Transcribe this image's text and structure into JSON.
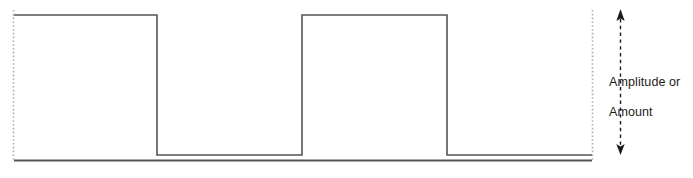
{
  "figure": {
    "background_color": "#ffffff",
    "width": 693,
    "height": 178
  },
  "annotation": {
    "name": "amplitude-or-amount",
    "line1": "Amplitude or",
    "line2": "Amount",
    "text_color": "#1c1c1c",
    "arrow": {
      "name": "double-headed-dashed-arrow",
      "style": "dashed",
      "heads": "both",
      "color": "#1c1c1c",
      "x": 620,
      "y_top": 10,
      "y_bottom": 155
    }
  },
  "guides": {
    "name": "dotted-vertical-guides",
    "color": "#b0b0b0",
    "style": "dotted",
    "lines": [
      {
        "x": 13,
        "y_top": 10,
        "y_bottom": 161
      },
      {
        "x": 592,
        "y_top": 10,
        "y_bottom": 161
      }
    ]
  },
  "axis": {
    "name": "baseline-axis",
    "color": "#555555",
    "y": 160,
    "x_start": 14,
    "x_end": 592,
    "thickness": 2
  },
  "chart_data": {
    "type": "line",
    "title": "Amplitude or Amount",
    "subtitle": "",
    "xlabel": "",
    "ylabel": "Amplitude or Amount",
    "grid": false,
    "legend": null,
    "waveform": "square",
    "stroke_color": "#555555",
    "stroke_width": 1.6,
    "xlim": [
      14,
      592
    ],
    "ylim": [
      155,
      15
    ],
    "level_high_y": 15,
    "level_low_y": 155,
    "series": [
      {
        "name": "square-wave",
        "points": [
          [
            14,
            15
          ],
          [
            157,
            15
          ],
          [
            157,
            155
          ],
          [
            302,
            155
          ],
          [
            302,
            15
          ],
          [
            447,
            15
          ],
          [
            447,
            155
          ],
          [
            592,
            155
          ]
        ]
      }
    ],
    "pulses": [
      {
        "index": 1,
        "rise_x": 14,
        "fall_x": 157,
        "width": 143,
        "level": "high"
      },
      {
        "index": 2,
        "rise_x": 302,
        "fall_x": 447,
        "width": 145,
        "level": "high"
      }
    ],
    "gaps": [
      {
        "index": 1,
        "start_x": 157,
        "end_x": 302,
        "width": 145,
        "level": "low"
      },
      {
        "index": 2,
        "start_x": 447,
        "end_x": 592,
        "width": 145,
        "level": "low"
      }
    ]
  }
}
